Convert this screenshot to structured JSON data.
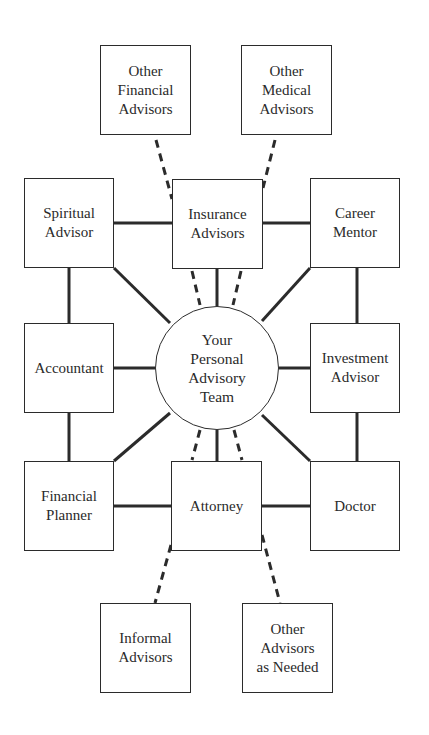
{
  "diagram": {
    "center": {
      "label": "Your\nPersonal\nAdvisory\nTeam"
    },
    "nodes": {
      "other_financial": {
        "label": "Other\nFinancial\nAdvisors"
      },
      "other_medical": {
        "label": "Other\nMedical\nAdvisors"
      },
      "spiritual": {
        "label": "Spiritual\nAdvisor"
      },
      "insurance": {
        "label": "Insurance\nAdvisors"
      },
      "career": {
        "label": "Career\nMentor"
      },
      "accountant": {
        "label": "Accountant"
      },
      "investment": {
        "label": "Investment\nAdvisor"
      },
      "financial_planner": {
        "label": "Financial\nPlanner"
      },
      "attorney": {
        "label": "Attorney"
      },
      "doctor": {
        "label": "Doctor"
      },
      "informal": {
        "label": "Informal\nAdvisors"
      },
      "other_needed": {
        "label": "Other\nAdvisors\nas Needed"
      }
    },
    "edges_solid": [
      [
        "spiritual",
        "insurance"
      ],
      [
        "insurance",
        "career"
      ],
      [
        "spiritual",
        "accountant"
      ],
      [
        "career",
        "investment"
      ],
      [
        "accountant",
        "financial_planner"
      ],
      [
        "investment",
        "doctor"
      ],
      [
        "financial_planner",
        "attorney"
      ],
      [
        "attorney",
        "doctor"
      ],
      [
        "center",
        "spiritual"
      ],
      [
        "center",
        "insurance"
      ],
      [
        "center",
        "career"
      ],
      [
        "center",
        "accountant"
      ],
      [
        "center",
        "investment"
      ],
      [
        "center",
        "financial_planner"
      ],
      [
        "center",
        "attorney"
      ],
      [
        "center",
        "doctor"
      ]
    ],
    "edges_dashed": [
      [
        "other_financial",
        "insurance"
      ],
      [
        "other_medical",
        "insurance"
      ],
      [
        "insurance",
        "center"
      ],
      [
        "insurance",
        "center"
      ],
      [
        "center",
        "attorney"
      ],
      [
        "center",
        "attorney"
      ],
      [
        "attorney",
        "informal"
      ],
      [
        "attorney",
        "other_needed"
      ]
    ],
    "colors": {
      "stroke": "#2b2b2b",
      "background": "#ffffff",
      "text": "#2a2a2a"
    }
  }
}
